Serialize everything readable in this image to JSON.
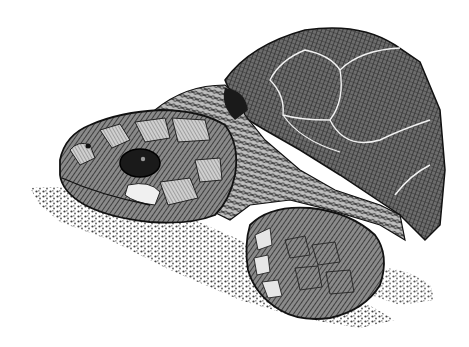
{
  "image": {
    "subject": "sea turtle",
    "style": "pen-and-ink crosshatch illustration",
    "background": "#ffffff",
    "ink": "#1a1a1a",
    "parts": [
      "shell",
      "head",
      "eye",
      "neck",
      "front-flipper",
      "sand"
    ]
  }
}
